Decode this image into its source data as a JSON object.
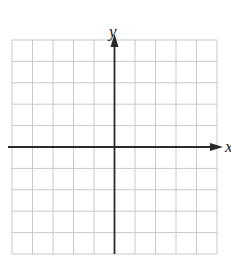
{
  "diagram": {
    "type": "coordinate-grid",
    "grid": {
      "columns": 10,
      "rows": 10,
      "left": 12,
      "top": 40,
      "right": 217,
      "bottom": 254,
      "line_color": "#c8c8c8"
    },
    "axes": {
      "color": "#2a2a2a",
      "x_label": "x",
      "y_label": "y",
      "origin_col": 5,
      "origin_row": 5
    }
  }
}
